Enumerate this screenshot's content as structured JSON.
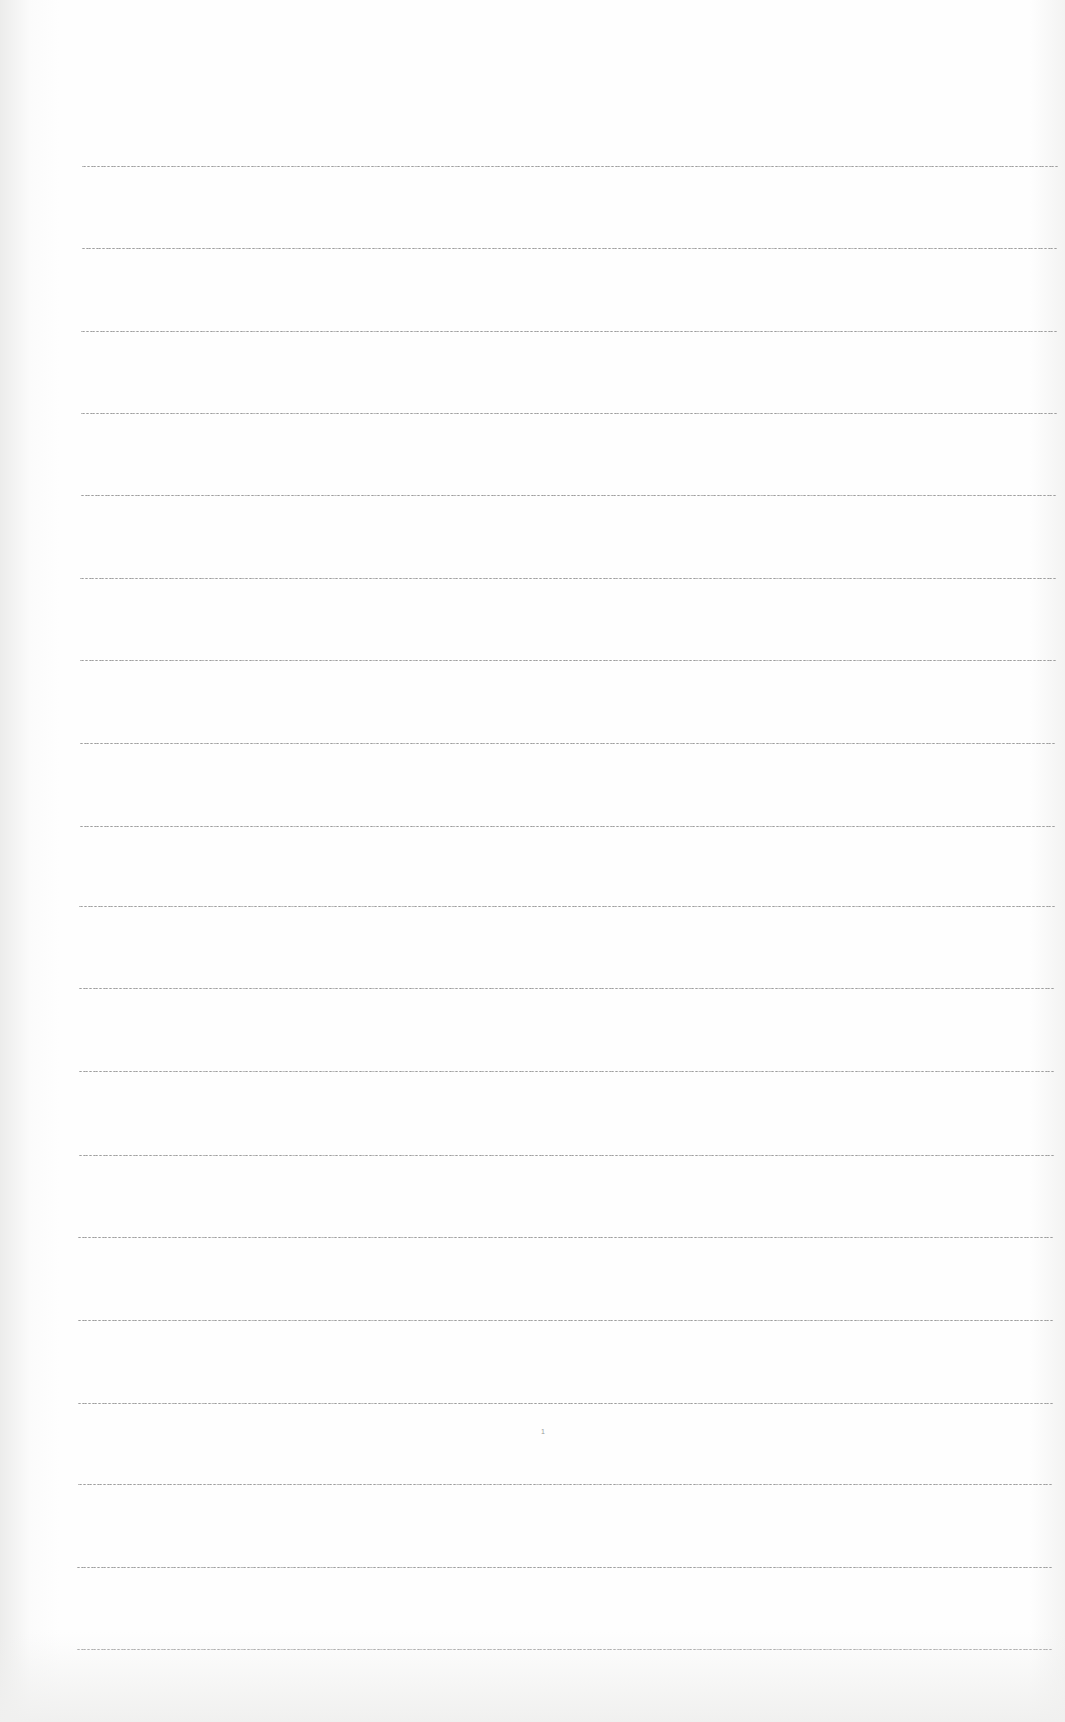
{
  "page": {
    "type": "lined-paper",
    "page_number": "1",
    "rule_color": "#8e8e8e",
    "background_color": "#fefefe",
    "rules": [
      {
        "y": 166,
        "x1": 82,
        "x2": 1058
      },
      {
        "y": 248,
        "x1": 82,
        "x2": 1057
      },
      {
        "y": 331,
        "x1": 81,
        "x2": 1057
      },
      {
        "y": 413,
        "x1": 81,
        "x2": 1057
      },
      {
        "y": 495,
        "x1": 81,
        "x2": 1056
      },
      {
        "y": 578,
        "x1": 80,
        "x2": 1056
      },
      {
        "y": 660,
        "x1": 80,
        "x2": 1056
      },
      {
        "y": 743,
        "x1": 80,
        "x2": 1055
      },
      {
        "y": 826,
        "x1": 80,
        "x2": 1055
      },
      {
        "y": 906,
        "x1": 79,
        "x2": 1055
      },
      {
        "y": 988,
        "x1": 79,
        "x2": 1054
      },
      {
        "y": 1071,
        "x1": 79,
        "x2": 1054
      },
      {
        "y": 1155,
        "x1": 79,
        "x2": 1054
      },
      {
        "y": 1237,
        "x1": 78,
        "x2": 1053
      },
      {
        "y": 1320,
        "x1": 78,
        "x2": 1053
      },
      {
        "y": 1403,
        "x1": 78,
        "x2": 1053
      },
      {
        "y": 1484,
        "x1": 78,
        "x2": 1052
      },
      {
        "y": 1567,
        "x1": 77,
        "x2": 1052
      },
      {
        "y": 1649,
        "x1": 77,
        "x2": 1052
      }
    ]
  }
}
